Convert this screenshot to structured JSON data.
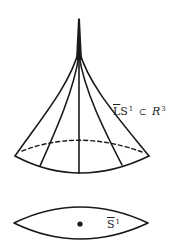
{
  "figure": {
    "surface_label": {
      "main": "LS",
      "overbar_part": "L",
      "superscript": "1",
      "relation": "⊂",
      "space": "R",
      "space_superscript": "3",
      "full_text": "L̄S¹ ⊂ R³"
    },
    "base_label": {
      "main": "S",
      "superscript": "1",
      "full_text": "S̄¹"
    },
    "colors": {
      "stroke": "#1a1a1a",
      "background": "#ffffff"
    }
  }
}
